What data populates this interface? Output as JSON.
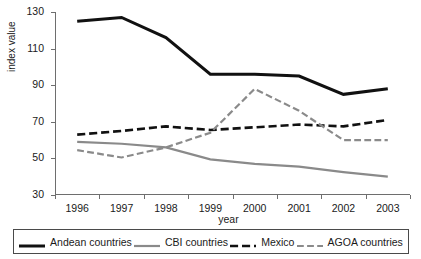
{
  "figure": {
    "crop_remnant_text": "",
    "background_color": "#ffffff"
  },
  "chart_data": {
    "type": "line",
    "title": "",
    "xlabel": "year",
    "ylabel": "index value",
    "categories": [
      "1996",
      "1997",
      "1998",
      "1999",
      "2000",
      "2001",
      "2002",
      "2003"
    ],
    "x": [
      1996,
      1997,
      1998,
      1999,
      2000,
      2001,
      2002,
      2003
    ],
    "ylim": [
      30,
      130
    ],
    "yticks": [
      30,
      50,
      70,
      90,
      110,
      130
    ],
    "ytick_labels": [
      "30",
      "50",
      "70",
      "90",
      "110",
      "130"
    ],
    "grid": false,
    "legend_position": "bottom",
    "series": [
      {
        "name": "Andean countries",
        "values": [
          125,
          127,
          116,
          96,
          96,
          95,
          85,
          88
        ],
        "color": "#111111",
        "style": "solid",
        "width": 3.0
      },
      {
        "name": "CBI countries",
        "values": [
          59,
          58,
          56,
          49.5,
          47,
          45.5,
          42.5,
          40
        ],
        "color": "#8a8a8a",
        "style": "solid",
        "width": 2.2
      },
      {
        "name": "Mexico",
        "values": [
          63,
          65,
          67.5,
          65.5,
          67,
          68.5,
          67.5,
          71
        ],
        "color": "#111111",
        "style": "dash-dot",
        "width": 2.6
      },
      {
        "name": "AGOA countries",
        "values": [
          54.5,
          50.5,
          56,
          64,
          88,
          76,
          60,
          60
        ],
        "color": "#8a8a8a",
        "style": "dash-dot",
        "width": 2.2
      }
    ]
  },
  "legend": {
    "items": [
      {
        "label": "Andean countries"
      },
      {
        "label": "CBI countries"
      },
      {
        "label": "Mexico"
      },
      {
        "label": "AGOA countries"
      }
    ]
  }
}
